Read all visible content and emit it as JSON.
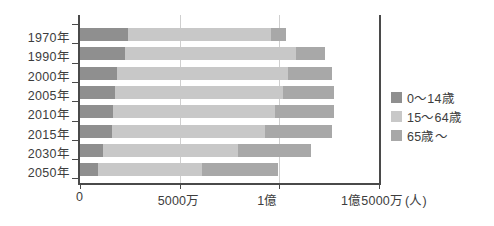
{
  "chart_data": {
    "type": "bar",
    "orientation": "horizontal",
    "stacked": true,
    "title": "",
    "xlabel": "(人)",
    "ylabel": "",
    "xlim": [
      0,
      150000000
    ],
    "grid": true,
    "legend_position": "right",
    "categories": [
      "1970年",
      "1990年",
      "2000年",
      "2005年",
      "2010年",
      "2015年",
      "2030年",
      "2050年"
    ],
    "xticks": [
      {
        "value": 0,
        "label": "0"
      },
      {
        "value": 50000000,
        "label": "5000万"
      },
      {
        "value": 100000000,
        "label": "1億"
      },
      {
        "value": 150000000,
        "label": "1億5000万"
      }
    ],
    "unit_note": "(人)",
    "series": [
      {
        "name": "0〜14歳",
        "color": "#8f8f8f",
        "values": [
          24000000,
          22500000,
          18500000,
          17600000,
          16800000,
          16000000,
          11600000,
          9000000
        ]
      },
      {
        "name": "15〜64歳",
        "color": "#c8c8c8",
        "values": [
          72000000,
          86000000,
          86000000,
          84000000,
          81000000,
          77000000,
          67500000,
          52000000
        ]
      },
      {
        "name": "65歳〜",
        "color": "#a8a8a8",
        "values": [
          7300000,
          14500000,
          22000000,
          25700000,
          29500000,
          33500000,
          37000000,
          38500000
        ]
      }
    ],
    "totals": [
      103300000,
      123000000,
      126500000,
      127300000,
      127300000,
      126500000,
      116100000,
      99500000
    ]
  },
  "legend": {
    "items": [
      {
        "label": "0〜14歳",
        "color": "#8f8f8f",
        "name": "legend-0-14"
      },
      {
        "label": "15〜64歳",
        "color": "#c8c8c8",
        "name": "legend-15-64"
      },
      {
        "label": "65歳〜",
        "color": "#a8a8a8",
        "name": "legend-65-up"
      }
    ]
  },
  "axis": {
    "unit_label": "(人)"
  },
  "colors": {
    "axis": "#4a4a4a",
    "grid": "#cfcfcf",
    "text": "#3d3d3d",
    "background": "#ffffff"
  }
}
